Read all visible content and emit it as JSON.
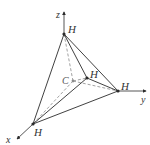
{
  "diagram": {
    "axes": {
      "x": {
        "label": "x"
      },
      "y": {
        "label": "y"
      },
      "z": {
        "label": "z"
      }
    },
    "atoms": {
      "center": {
        "label": "C"
      },
      "h_top": {
        "label": "H"
      },
      "h_middle": {
        "label": "H"
      },
      "h_right": {
        "label": "H"
      },
      "h_bottom": {
        "label": "H"
      }
    },
    "colors": {
      "solid_edge": "#2b2b2b",
      "dashed_bond": "#8a8a8a",
      "text": "#333333"
    }
  }
}
